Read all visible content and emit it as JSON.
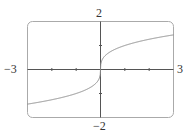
{
  "chart_data": {
    "type": "line",
    "title": "",
    "xlabel": "",
    "ylabel": "",
    "xlim": [
      -3,
      3
    ],
    "ylim": [
      -2,
      2
    ],
    "grid": false,
    "legend": null,
    "tick_labels": {
      "x_min": "−3",
      "x_max": "3",
      "y_max": "2",
      "y_min": "−2"
    },
    "ticks": {
      "x": [
        -2,
        -1,
        1,
        2
      ],
      "y": [
        -1,
        1
      ]
    },
    "series": [
      {
        "name": "y = x^(1/3)",
        "x": [
          -3,
          -2,
          -1,
          -0.5,
          -0.2,
          -0.05,
          0,
          0.05,
          0.2,
          0.5,
          1,
          2,
          3
        ],
        "values": [
          -1.44,
          -1.26,
          -1.0,
          -0.79,
          -0.58,
          -0.37,
          0,
          0.37,
          0.58,
          0.79,
          1.0,
          1.26,
          1.44
        ]
      }
    ],
    "colors": {
      "curve": "#888888",
      "axes": "#555555",
      "frame": "#999999"
    }
  }
}
